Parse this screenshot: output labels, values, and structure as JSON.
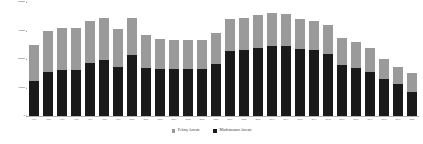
{
  "chart_data": {
    "type": "bar",
    "stacked": true,
    "title": "",
    "subtitle": "",
    "xlabel": "",
    "ylabel": "",
    "ylim": [
      0,
      40000
    ],
    "yticks": [
      0,
      10000,
      20000,
      30000,
      40000
    ],
    "ytick_labels": [
      "0",
      "10000",
      "20000",
      "30000",
      "40000"
    ],
    "grid": false,
    "legend_position": "bottom-center",
    "categories": [
      "1993",
      "1994",
      "1995",
      "1996",
      "1997",
      "1998",
      "1999",
      "2000",
      "2001",
      "2002",
      "2003",
      "2004",
      "2005",
      "2006",
      "2007",
      "2008",
      "2009",
      "2010",
      "2011",
      "2012",
      "2013",
      "2014",
      "2015",
      "2016",
      "2017",
      "2018",
      "2019",
      "2020"
    ],
    "series": [
      {
        "name": "Misdemeanor Arrests",
        "color": "#1a1a1a",
        "values": [
          12400,
          15300,
          16200,
          16300,
          18600,
          19800,
          17200,
          21400,
          17000,
          16500,
          16500,
          16500,
          16500,
          18400,
          22800,
          23000,
          24000,
          24600,
          24600,
          23400,
          23000,
          21600,
          18000,
          17000,
          15600,
          12900,
          11300,
          8300
        ]
      },
      {
        "name": "Felony Arrests",
        "color": "#9a9a9a",
        "values": [
          12600,
          14400,
          14600,
          14600,
          14600,
          14700,
          13200,
          13000,
          11400,
          10600,
          10000,
          10300,
          10300,
          10600,
          11300,
          11300,
          11500,
          11500,
          11300,
          10700,
          10500,
          10300,
          9500,
          9000,
          8400,
          7200,
          5900,
          6700
        ]
      }
    ],
    "totals": [
      25000,
      29700,
      30800,
      30900,
      33200,
      34500,
      30400,
      34400,
      28400,
      27100,
      26500,
      26800,
      26800,
      29000,
      34100,
      34300,
      35500,
      36100,
      35900,
      34100,
      33500,
      31900,
      27500,
      26000,
      24000,
      20100,
      17200,
      15000
    ]
  },
  "legend": {
    "items": [
      {
        "label": "Felony Arrests",
        "color": "#9a9a9a"
      },
      {
        "label": "Misdemeanor Arrests",
        "color": "#1a1a1a"
      }
    ]
  }
}
